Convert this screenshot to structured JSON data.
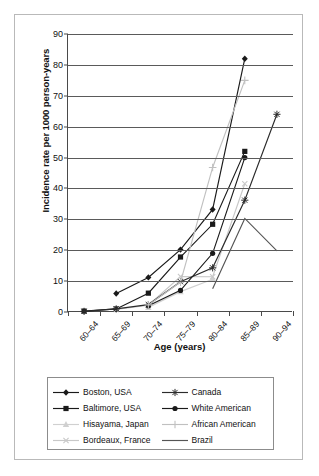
{
  "chart_data": {
    "type": "line",
    "title": "",
    "xlabel": "Age (years)",
    "ylabel": "Incidence rate per 1000 person-years",
    "categories": [
      "60–64",
      "65–69",
      "70–74",
      "75–79",
      "80–84",
      "85–89",
      "90–94"
    ],
    "ylim": [
      0,
      90
    ],
    "yticks": [
      0,
      10,
      20,
      30,
      40,
      50,
      60,
      70,
      80,
      90
    ],
    "grid": "horizontal",
    "legend_position": "below-plot",
    "series": [
      {
        "name": "Boston, USA",
        "color": "#1a1a1a",
        "marker": "diamond",
        "values": [
          null,
          6.0,
          11.2,
          20.2,
          33.2,
          82.0,
          null
        ]
      },
      {
        "name": "Baltimore, USA",
        "color": "#1a1a1a",
        "marker": "square",
        "values": [
          0.3,
          1.0,
          6.1,
          17.8,
          28.4,
          52.0,
          null
        ]
      },
      {
        "name": "Hisayama, Japan",
        "color": "#d0d0d0",
        "marker": "triangle",
        "values": [
          null,
          null,
          1.5,
          6.6,
          10.6,
          null,
          null
        ]
      },
      {
        "name": "Bordeaux, France",
        "color": "#c8c8c8",
        "marker": "cross-x",
        "values": [
          null,
          0.8,
          2.2,
          11.5,
          11.4,
          41.5,
          null
        ]
      },
      {
        "name": "Canada",
        "color": "#2b2b2b",
        "marker": "star",
        "values": [
          0.2,
          1.0,
          2.4,
          9.8,
          14.3,
          36.2,
          64.0
        ]
      },
      {
        "name": "White American",
        "color": "#1a1a1a",
        "marker": "circle",
        "values": [
          null,
          null,
          2.0,
          7.0,
          19.0,
          50.0,
          null
        ]
      },
      {
        "name": "African American",
        "color": "#c0c0c0",
        "marker": "plus",
        "values": [
          null,
          null,
          2.3,
          9.7,
          46.8,
          75.0,
          null
        ]
      },
      {
        "name": "Brazil",
        "color": "#555555",
        "marker": "none",
        "values": [
          null,
          null,
          null,
          null,
          7.5,
          30.3,
          19.8
        ]
      }
    ]
  },
  "legend": {
    "items": [
      {
        "label": "Boston, USA"
      },
      {
        "label": "Canada"
      },
      {
        "label": "Baltimore, USA"
      },
      {
        "label": "White American"
      },
      {
        "label": "Hisayama, Japan"
      },
      {
        "label": "African American"
      },
      {
        "label": "Bordeaux, France"
      },
      {
        "label": "Brazil"
      }
    ],
    "order": [
      0,
      4,
      1,
      5,
      2,
      6,
      3,
      7
    ]
  }
}
